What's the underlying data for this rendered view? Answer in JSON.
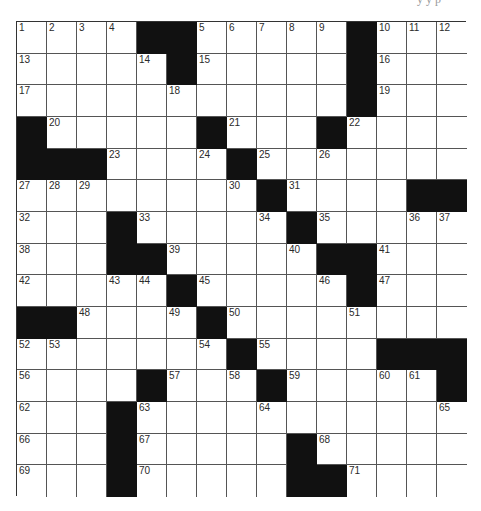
{
  "puzzle": {
    "header_fragment": "y  y  p",
    "rows": 15,
    "cols": 15,
    "colors": {
      "block": "#111111",
      "cell": "#ffffff",
      "line": "#555555",
      "number": "#2a2a2a"
    },
    "grid": [
      [
        "1",
        "2",
        "3",
        "4",
        "#",
        "#",
        "5",
        "6",
        "7",
        "8",
        "9",
        "#",
        "10",
        "11",
        "12"
      ],
      [
        "13",
        ".",
        ".",
        ".",
        "14",
        "#",
        "15",
        ".",
        ".",
        ".",
        ".",
        "#",
        "16",
        ".",
        "."
      ],
      [
        "17",
        ".",
        ".",
        ".",
        ".",
        "18",
        ".",
        ".",
        ".",
        ".",
        ".",
        "#",
        "19",
        ".",
        "."
      ],
      [
        "#",
        "20",
        ".",
        ".",
        ".",
        ".",
        "#",
        "21",
        ".",
        ".",
        "#",
        "22",
        ".",
        ".",
        "."
      ],
      [
        "#",
        "#",
        "#",
        "23",
        ".",
        ".",
        "24",
        "#",
        "25",
        ".",
        "26",
        ".",
        ".",
        ".",
        "."
      ],
      [
        "27",
        "28",
        "29",
        ".",
        ".",
        ".",
        ".",
        "30",
        "#",
        "31",
        ".",
        ".",
        ".",
        "#",
        "#"
      ],
      [
        "32",
        ".",
        ".",
        "#",
        "33",
        ".",
        ".",
        ".",
        "34",
        "#",
        "35",
        ".",
        ".",
        "36",
        "37"
      ],
      [
        "38",
        ".",
        ".",
        "#",
        "#",
        "39",
        ".",
        ".",
        ".",
        "40",
        "#",
        "#",
        "41",
        ".",
        "."
      ],
      [
        "42",
        ".",
        ".",
        "43",
        "44",
        "#",
        "45",
        ".",
        ".",
        ".",
        "46",
        "#",
        "47",
        ".",
        "."
      ],
      [
        "#",
        "#",
        "48",
        ".",
        ".",
        "49",
        "#",
        "50",
        ".",
        ".",
        ".",
        "51",
        ".",
        ".",
        "."
      ],
      [
        "52",
        "53",
        ".",
        ".",
        ".",
        ".",
        "54",
        "#",
        "55",
        ".",
        ".",
        ".",
        "#",
        "#",
        "#"
      ],
      [
        "56",
        ".",
        ".",
        ".",
        "#",
        "57",
        ".",
        "58",
        "#",
        "59",
        ".",
        ".",
        "60",
        "61",
        "#"
      ],
      [
        "62",
        ".",
        ".",
        "#",
        "63",
        ".",
        ".",
        ".",
        "64",
        ".",
        ".",
        ".",
        ".",
        ".",
        "65"
      ],
      [
        "66",
        ".",
        ".",
        "#",
        "67",
        ".",
        ".",
        ".",
        ".",
        "#",
        "68",
        ".",
        ".",
        ".",
        "."
      ],
      [
        "69",
        ".",
        ".",
        "#",
        "70",
        ".",
        ".",
        ".",
        ".",
        "#",
        "#",
        "71",
        ".",
        ".",
        "."
      ]
    ]
  }
}
